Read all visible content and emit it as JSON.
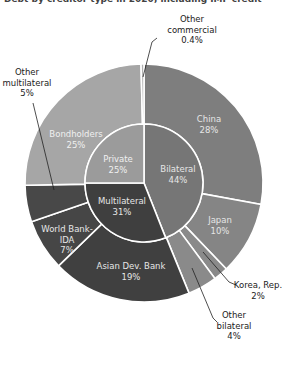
{
  "title": "Debt by creditor type in 2020, including IMF credit",
  "chart_data": {
    "type": "pie",
    "subtype": "nested-donut (sunburst)",
    "title": "",
    "start_angle_deg": 0,
    "direction": "clockwise",
    "inner_ring": [
      {
        "label": "Bilateral",
        "value": 44,
        "display": "44%",
        "color": "#767676"
      },
      {
        "label": "Multilateral",
        "value": 31,
        "display": "31%",
        "color": "#3f3f3f"
      },
      {
        "label": "Private",
        "value": 25,
        "display": "25%",
        "color": "#9b9b9b"
      }
    ],
    "outer_ring": [
      {
        "label": "China",
        "value": 28,
        "display": "28%",
        "parent": "Bilateral",
        "color": "#7e7e7e"
      },
      {
        "label": "Japan",
        "value": 10,
        "display": "10%",
        "parent": "Bilateral",
        "color": "#858585"
      },
      {
        "label": "Korea, Rep.",
        "value": 2,
        "display": "2%",
        "parent": "Bilateral",
        "color": "#8a8a8a"
      },
      {
        "label": "Other bilateral",
        "value": 4,
        "display": "4%",
        "parent": "Bilateral",
        "color": "#8a8a8a"
      },
      {
        "label": "Asian Dev. Bank",
        "value": 19,
        "display": "19%",
        "parent": "Multilateral",
        "color": "#404040"
      },
      {
        "label": "World Bank-IDA",
        "value": 7,
        "display": "7%",
        "parent": "Multilateral",
        "color": "#464646"
      },
      {
        "label": "Other multilateral",
        "value": 5,
        "display": "5%",
        "parent": "Multilateral",
        "color": "#484848"
      },
      {
        "label": "Bondholders",
        "value": 25,
        "display": "25%",
        "parent": "Private",
        "color": "#a6a6a6"
      },
      {
        "label": "Other commercial",
        "value": 0.4,
        "display": "0.4%",
        "parent": "Private",
        "color": "#b0b0b0"
      }
    ],
    "legend": "none (direct labels with leader lines)"
  },
  "labels": {
    "bilateral": {
      "name": "Bilateral",
      "pct": "44%"
    },
    "multilateral": {
      "name": "Multilateral",
      "pct": "31%"
    },
    "private": {
      "name": "Private",
      "pct": "25%"
    },
    "china": {
      "name": "China",
      "pct": "28%"
    },
    "japan": {
      "name": "Japan",
      "pct": "10%"
    },
    "korea": {
      "name": "Korea, Rep.",
      "pct": "2%"
    },
    "other_bilateral": {
      "line1": "Other",
      "line2": "bilateral",
      "pct": "4%"
    },
    "adb": {
      "name": "Asian Dev. Bank",
      "pct": "19%"
    },
    "wb": {
      "line1": "World Bank-",
      "line2": "IDA",
      "pct": "7%"
    },
    "other_multilateral": {
      "line1": "Other",
      "line2": "multilateral",
      "pct": "5%"
    },
    "bondholders": {
      "name": "Bondholders",
      "pct": "25%"
    },
    "other_commercial": {
      "line1": "Other",
      "line2": "commercial",
      "pct": "0.4%"
    }
  }
}
